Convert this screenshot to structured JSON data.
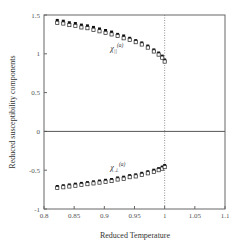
{
  "chart_data": {
    "type": "scatter",
    "title": "",
    "xlabel": "Reduced Temperature",
    "ylabel": "Reduced susceptibility components",
    "xlim": [
      0.8,
      1.1
    ],
    "ylim": [
      -1,
      1.5
    ],
    "xticks": [
      0.8,
      0.85,
      0.9,
      0.95,
      1,
      1.05,
      1.1
    ],
    "xtick_labels": [
      "0.8",
      "0.85",
      "0.9",
      "0.95",
      "1",
      "1.05",
      "1.1"
    ],
    "yticks": [
      -1,
      -0.5,
      0,
      0.5,
      1,
      1.5
    ],
    "ytick_labels": [
      "-1",
      "-0.5",
      "0",
      "0.5",
      "1",
      "1.5"
    ],
    "grid": false,
    "hlines": [
      0
    ],
    "vlines": [
      {
        "x": 1,
        "style": "dotted"
      }
    ],
    "annotations": [
      {
        "text": "χ∥(a)",
        "base": "χ",
        "sub": "||",
        "sup": "(a)",
        "x": 0.91,
        "y": 1.03
      },
      {
        "text": "χ⊥(a)",
        "base": "χ",
        "sub": "⊥",
        "sup": "(a)",
        "x": 0.91,
        "y": -0.5
      }
    ],
    "series": [
      {
        "name": "chi_parallel_filled",
        "marker": "filled-square",
        "x": [
          0.822,
          0.832,
          0.842,
          0.852,
          0.862,
          0.872,
          0.882,
          0.892,
          0.902,
          0.912,
          0.922,
          0.932,
          0.942,
          0.952,
          0.962,
          0.972,
          0.982,
          0.99,
          0.996,
          1.0
        ],
        "y": [
          1.43,
          1.42,
          1.4,
          1.39,
          1.37,
          1.36,
          1.34,
          1.32,
          1.3,
          1.28,
          1.25,
          1.23,
          1.2,
          1.17,
          1.14,
          1.1,
          1.05,
          1.01,
          0.97,
          0.92
        ]
      },
      {
        "name": "chi_parallel_open",
        "marker": "open-square",
        "x": [
          0.822,
          0.832,
          0.842,
          0.852,
          0.862,
          0.872,
          0.882,
          0.892,
          0.902,
          0.912,
          0.922,
          0.932,
          0.942,
          0.952,
          0.962,
          0.972,
          0.982,
          0.99,
          0.996,
          1.0
        ],
        "y": [
          1.4,
          1.39,
          1.37,
          1.36,
          1.34,
          1.33,
          1.31,
          1.29,
          1.27,
          1.25,
          1.23,
          1.2,
          1.18,
          1.15,
          1.12,
          1.08,
          1.03,
          0.99,
          0.95,
          0.9
        ]
      },
      {
        "name": "chi_perp_filled",
        "marker": "filled-square",
        "x": [
          0.822,
          0.832,
          0.842,
          0.852,
          0.862,
          0.872,
          0.882,
          0.892,
          0.902,
          0.912,
          0.922,
          0.932,
          0.942,
          0.952,
          0.962,
          0.972,
          0.982,
          0.99,
          0.996,
          1.0
        ],
        "y": [
          -0.71,
          -0.7,
          -0.69,
          -0.68,
          -0.67,
          -0.66,
          -0.65,
          -0.64,
          -0.63,
          -0.62,
          -0.6,
          -0.59,
          -0.57,
          -0.56,
          -0.54,
          -0.52,
          -0.5,
          -0.48,
          -0.46,
          -0.44
        ]
      },
      {
        "name": "chi_perp_open",
        "marker": "open-square",
        "x": [
          0.822,
          0.832,
          0.842,
          0.852,
          0.862,
          0.872,
          0.882,
          0.892,
          0.902,
          0.912,
          0.922,
          0.932,
          0.942,
          0.952,
          0.962,
          0.972,
          0.982,
          0.99,
          0.996,
          1.0
        ],
        "y": [
          -0.73,
          -0.72,
          -0.71,
          -0.7,
          -0.69,
          -0.68,
          -0.67,
          -0.66,
          -0.65,
          -0.64,
          -0.62,
          -0.61,
          -0.59,
          -0.58,
          -0.56,
          -0.54,
          -0.52,
          -0.5,
          -0.48,
          -0.46
        ]
      }
    ]
  }
}
